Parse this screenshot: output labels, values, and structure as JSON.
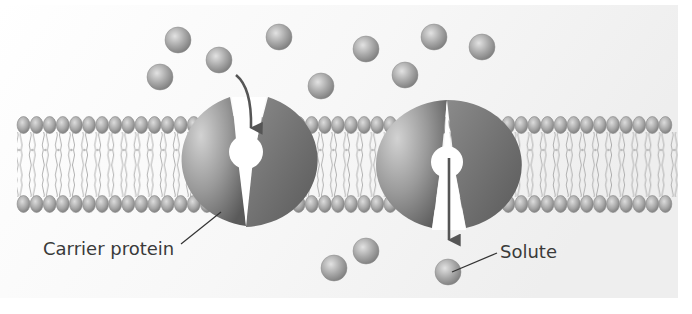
{
  "figure": {
    "labels": {
      "carrier_protein": "Carrier protein",
      "solute": "Solute"
    }
  },
  "colors": {
    "background_panel": "#f1f1f1",
    "protein_light": "#c9c9c9",
    "protein_dark": "#5e5e5e",
    "head_light": "#d4d4d4",
    "head_dark": "#7a7a7a",
    "tail": "#9a9a9a",
    "arrow": "#555555",
    "leader_line": "#333333",
    "text": "#3a3a3a"
  },
  "membrane": {
    "x_start": 17,
    "x_end": 678,
    "top_heads_y": 125,
    "bottom_heads_y": 204,
    "head_spacing": 13.1
  },
  "proteins": [
    {
      "name": "carrier-protein-open-outside",
      "cx": 247,
      "cy": 160,
      "rx": 75,
      "ry": 67,
      "state": "open-to-outside"
    },
    {
      "name": "carrier-protein-open-inside",
      "cx": 449,
      "cy": 164,
      "rx": 74,
      "ry": 65,
      "state": "open-to-inside"
    }
  ],
  "solutes": {
    "outside": [
      {
        "x": 178,
        "y": 40
      },
      {
        "x": 160,
        "y": 77
      },
      {
        "x": 219,
        "y": 60
      },
      {
        "x": 279,
        "y": 37
      },
      {
        "x": 321,
        "y": 86
      },
      {
        "x": 366,
        "y": 49
      },
      {
        "x": 434,
        "y": 37
      },
      {
        "x": 482,
        "y": 47
      },
      {
        "x": 405,
        "y": 75
      }
    ],
    "inside": [
      {
        "x": 334,
        "y": 268
      },
      {
        "x": 366,
        "y": 251
      },
      {
        "x": 448,
        "y": 272
      }
    ],
    "radius": 13
  }
}
